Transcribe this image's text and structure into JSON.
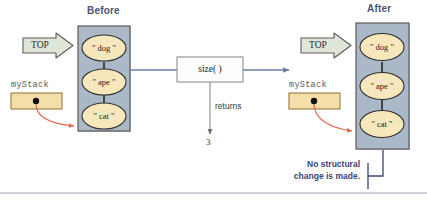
{
  "figure": {
    "before_heading": "Before",
    "after_heading": "After",
    "top_label_left": "TOP",
    "top_label_right": "TOP",
    "stack_var_left": "myStack",
    "stack_var_right": "myStack",
    "operation_label": "size( )",
    "returns_label": "returns",
    "return_value": "3",
    "note_line1": "No structural",
    "note_line2": "change is made."
  },
  "stack_before": {
    "items": [
      "\" dog \"",
      "\" ape \"",
      "\" cat \""
    ]
  },
  "stack_after": {
    "items": [
      "\" dog \"",
      "\" ape \"",
      "\" cat \""
    ]
  },
  "colors": {
    "panel_fill": "#aab8c8",
    "panel_stroke": "#5a5a5a",
    "node_fill": "#f7e7bd",
    "node_stroke": "#3a3a3a",
    "pointer_box_fill": "#f5dfa8",
    "pointer_box_stroke": "#8a7130",
    "top_arrow_fill": "#dfe6d8",
    "top_arrow_stroke": "#5c5c5c",
    "flow_arrow": "#6d7fa3",
    "pointer_arrow": "#e2684a",
    "note_text": "#3b4575",
    "heading_text": "#4a5770",
    "rule": "#9aa0ab"
  }
}
